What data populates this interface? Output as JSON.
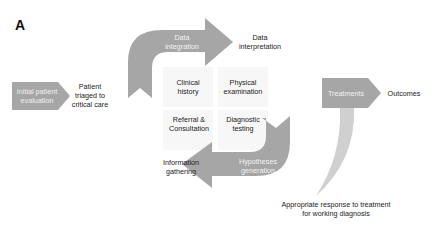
{
  "panel": {
    "letter": "A"
  },
  "colors": {
    "arrow_dark": "#a6a6a6",
    "arrow_light": "#d0d0d0",
    "center_box": "#f7f7f7",
    "text": "#222222",
    "arrow_text": "#f2f2f2"
  },
  "arrows": {
    "initial": {
      "label_line1": "Initial patient",
      "label_line2": "evaluation"
    },
    "data_integration": {
      "label_line1": "Data",
      "label_line2": "integration"
    },
    "hypotheses": {
      "label_line1": "Hypotheses",
      "label_line2": "generation"
    },
    "treatments": {
      "label": "Treatments"
    }
  },
  "labels": {
    "patient_triaged": {
      "line1": "Patient",
      "line2": "triaged to",
      "line3": "critical care"
    },
    "data_interpretation": {
      "line1": "Data",
      "line2": "interpretation"
    },
    "information_gathering": {
      "line1": "Information",
      "line2": "gathering"
    },
    "outcomes": {
      "line1": "Outcomes"
    },
    "appropriate_response": {
      "line1": "Appropriate response to treatment",
      "line2": "for working diagnosis"
    }
  },
  "center": {
    "clinical_history": {
      "line1": "Clinical",
      "line2": "history"
    },
    "physical_examination": {
      "line1": "Physical",
      "line2": "examination"
    },
    "referral_consultation": {
      "line1": "Referral &",
      "line2": "Consultation"
    },
    "diagnostic_testing": {
      "line1": "Diagnostic",
      "line2": "testing"
    }
  }
}
